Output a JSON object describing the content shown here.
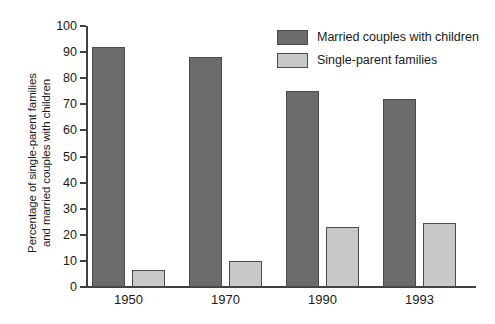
{
  "chart_data": {
    "type": "bar",
    "title": "",
    "subtitle": "",
    "xlabel": "",
    "ylabel": "Percentage of single-parent families and married couples with children",
    "ylabel_lines": [
      "Percentage of single-parent families",
      "and married couples with children"
    ],
    "categories": [
      "1950",
      "1970",
      "1990",
      "1993"
    ],
    "series": [
      {
        "name": "Married couples with children",
        "color": "#6b6b6b",
        "values": [
          92,
          88,
          75,
          72
        ]
      },
      {
        "name": "Single-parent families",
        "color": "#c8c8c8",
        "values": [
          6.5,
          10,
          23,
          24.5
        ]
      }
    ],
    "ylim": [
      0,
      100
    ],
    "yticks": [
      0,
      10,
      20,
      30,
      40,
      50,
      60,
      70,
      80,
      90,
      100
    ],
    "ytick_labels": [
      "0",
      "10",
      "20",
      "30",
      "40",
      "50",
      "60",
      "70",
      "80",
      "90",
      "100"
    ],
    "grid": false,
    "legend_position": "top-right"
  },
  "legend": {
    "entries": [
      {
        "label": "Married couples with children",
        "color": "#6b6b6b"
      },
      {
        "label": "Single-parent families",
        "color": "#c8c8c8"
      }
    ]
  },
  "colors": {
    "married": "#6b6b6b",
    "single": "#c8c8c8",
    "axis": "#404040",
    "background": "#ffffff"
  }
}
